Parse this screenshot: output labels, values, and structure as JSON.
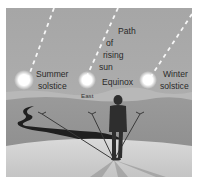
{
  "diagram": {
    "labels": {
      "path": [
        "Path",
        "of",
        "rising",
        "sun"
      ],
      "summer": [
        "Summer",
        "solstice"
      ],
      "equinox": "Equinox",
      "winter": [
        "Winter",
        "solstice"
      ],
      "east": "East"
    },
    "nodes": [
      {
        "id": "summer-sun",
        "label": "Summer solstice"
      },
      {
        "id": "equinox-sun",
        "label": "Equinox"
      },
      {
        "id": "winter-sun",
        "label": "Winter solstice"
      },
      {
        "id": "observer",
        "label": "Person facing east"
      }
    ],
    "edges": [
      {
        "from": "observer",
        "to": "summer-sun",
        "kind": "sight-line"
      },
      {
        "from": "observer",
        "to": "equinox-sun",
        "kind": "sight-line"
      },
      {
        "from": "observer",
        "to": "winter-sun",
        "kind": "sight-line"
      }
    ],
    "colors": {
      "sky": "#a9a9a9",
      "sun": "#ffffff",
      "far_hills": "#9c9c9c",
      "mid_ground": "#8f8f8f",
      "foreground": "#cfcfcf",
      "figure": "#2e2e2e",
      "river": "#1f1f1f"
    }
  }
}
